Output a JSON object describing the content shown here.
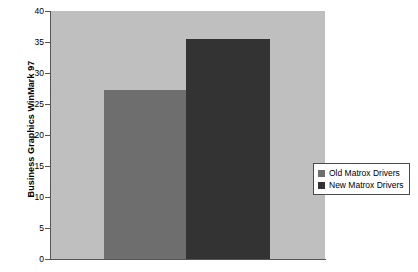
{
  "chart_data": {
    "type": "bar",
    "title": "",
    "xlabel": "",
    "ylabel": "Business Graphics WinMark 97",
    "ylim": [
      0,
      40
    ],
    "ytick_values": [
      0,
      5,
      10,
      15,
      20,
      25,
      30,
      35,
      40
    ],
    "ytick_labels": [
      "0",
      "5",
      "10",
      "15",
      "20",
      "25",
      "30",
      "35",
      "40"
    ],
    "grid": false,
    "legend_position": "right",
    "categories": [
      ""
    ],
    "series": [
      {
        "name": "Old Matrox Drivers",
        "values": [
          27.2
        ],
        "color": "#6e6e6e"
      },
      {
        "name": "New Matrox Drivers",
        "values": [
          35.5
        ],
        "color": "#333333"
      }
    ]
  },
  "legend": {
    "entries": [
      {
        "label": "Old Matrox Drivers",
        "color": "#6e6e6e"
      },
      {
        "label": "New Matrox Drivers",
        "color": "#333333"
      }
    ]
  },
  "style": {
    "plot_background": "#bfbfbf",
    "page_background": "#ffffff",
    "axis_color": "#555555",
    "text_color": "#000000"
  }
}
